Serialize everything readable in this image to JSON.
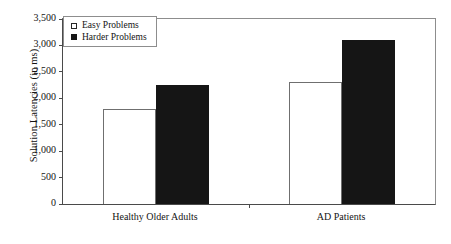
{
  "chart_data": {
    "type": "bar",
    "title": "",
    "subtitle": "",
    "xlabel": "",
    "ylabel": "Solution Latencies (in ms)",
    "categories": [
      "Healthy Older Adults",
      "AD Patients"
    ],
    "series": [
      {
        "name": "Easy Problems",
        "values": [
          1800,
          2300
        ],
        "swatch": "open",
        "color": "#ffffff"
      },
      {
        "name": "Harder Problems",
        "values": [
          2250,
          3100
        ],
        "swatch": "filled",
        "color": "#151515"
      }
    ],
    "ylim": [
      0,
      3500
    ],
    "yticks": [
      0,
      500,
      1000,
      1500,
      2000,
      2500,
      3000,
      3500
    ],
    "ytick_labels": [
      "0",
      "500",
      "1,000",
      "1,500",
      "2,000",
      "2,500",
      "3,000",
      "3,500"
    ],
    "grid": false,
    "legend_position": "top-left",
    "annotations": []
  },
  "axes": {
    "y_title": "Solution Latencies (in ms)"
  },
  "legend": {
    "entries": [
      {
        "label": "Easy Problems"
      },
      {
        "label": "Harder Problems"
      }
    ]
  }
}
